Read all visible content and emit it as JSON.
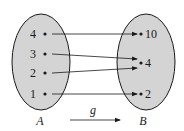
{
  "diagram": {
    "function_name": "g",
    "domain_set": {
      "label": "A",
      "elements": [
        "4",
        "3",
        "2",
        "1"
      ]
    },
    "codomain_set": {
      "label": "B",
      "elements": [
        "10",
        "4",
        "2"
      ]
    },
    "mappings": [
      {
        "from": "4",
        "to": "10"
      },
      {
        "from": "3",
        "to": "4"
      },
      {
        "from": "2",
        "to": "4"
      },
      {
        "from": "1",
        "to": "2"
      }
    ],
    "colors": {
      "set_fill": "#d4d4d4",
      "stroke": "#1a1a1a",
      "background": "#ffffff"
    }
  }
}
